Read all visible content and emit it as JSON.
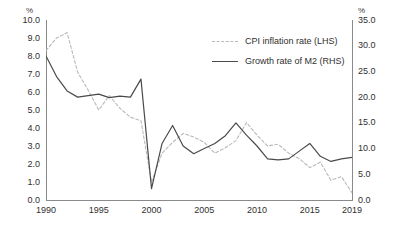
{
  "chart_data": {
    "type": "line",
    "title": "",
    "xlabel": "",
    "ylabel": "%",
    "y2label": "%",
    "grid": false,
    "legend_position": "upper-center",
    "x": [
      1990,
      1991,
      1992,
      1993,
      1994,
      1995,
      1996,
      1997,
      1998,
      1999,
      2000,
      2001,
      2002,
      2003,
      2004,
      2005,
      2006,
      2007,
      2008,
      2009,
      2010,
      2011,
      2012,
      2013,
      2014,
      2015,
      2016,
      2017,
      2018,
      2019
    ],
    "xtick_labels": [
      "1990",
      "1995",
      "2000",
      "2005",
      "2010",
      "2015",
      "2019"
    ],
    "xticks": [
      1990,
      1995,
      2000,
      2005,
      2010,
      2015,
      2019
    ],
    "xlim": [
      1990,
      2019
    ],
    "ylim": [
      0.0,
      10.0
    ],
    "yticks": [
      0.0,
      1.0,
      2.0,
      3.0,
      4.0,
      5.0,
      6.0,
      7.0,
      8.0,
      9.0,
      10.0
    ],
    "ytick_labels": [
      "0.0",
      "1.0",
      "2.0",
      "3.0",
      "4.0",
      "5.0",
      "6.0",
      "7.0",
      "8.0",
      "9.0",
      "10.0"
    ],
    "y2lim": [
      0.0,
      35.0
    ],
    "y2ticks": [
      0.0,
      5.0,
      10.0,
      15.0,
      20.0,
      25.0,
      30.0,
      35.0
    ],
    "y2tick_labels": [
      "0.0",
      "5.0",
      "10.0",
      "15.0",
      "20.0",
      "25.0",
      "30.0",
      "35.0"
    ],
    "series": [
      {
        "name": "CPI inflation rate (LHS)",
        "axis": "left",
        "style": "dashed",
        "color": "#b9b9b9",
        "values": [
          8.3,
          9.0,
          9.3,
          7.1,
          6.1,
          5.0,
          5.8,
          5.1,
          4.6,
          4.4,
          1.0,
          2.6,
          3.2,
          3.7,
          3.5,
          3.2,
          2.6,
          2.9,
          3.3,
          4.3,
          3.6,
          3.0,
          3.1,
          2.6,
          2.3,
          1.8,
          2.1,
          1.1,
          1.3,
          0.4
        ]
      },
      {
        "name": "Growth rate of M2 (RHS)",
        "axis": "right",
        "style": "solid",
        "color": "#4a4a4a",
        "values": [
          28.0,
          24.0,
          21.2,
          20.0,
          20.3,
          20.6,
          19.9,
          20.2,
          20.0,
          23.5,
          2.2,
          11.0,
          14.5,
          10.5,
          9.0,
          10.0,
          11.0,
          12.5,
          15.0,
          12.6,
          10.5,
          8.0,
          7.8,
          8.0,
          9.5,
          11.0,
          8.5,
          7.5,
          8.0,
          8.3
        ]
      }
    ]
  },
  "legend": {
    "items": [
      {
        "label": "CPI inflation rate (LHS)",
        "style": "dashed"
      },
      {
        "label": "Growth rate of M2 (RHS)",
        "style": "solid"
      }
    ]
  },
  "axes": {
    "left_unit": "%",
    "right_unit": "%"
  }
}
